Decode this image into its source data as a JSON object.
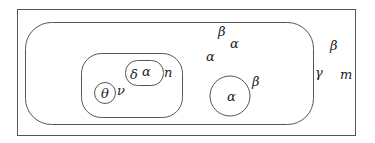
{
  "diagram": {
    "type": "nested-sets",
    "labels": {
      "outer_beta": "β",
      "outer_gamma": "γ",
      "outer_m": "m",
      "big_beta_top": "β",
      "big_alpha_top": "α",
      "big_alpha_left": "α",
      "inner_n": "n",
      "inner_nu": "ν",
      "pill_delta": "δ",
      "pill_alpha": "α",
      "small_theta": "θ",
      "right_circle_alpha": "α",
      "right_circle_beta": "β"
    },
    "stroke_color": "#555555",
    "text_color": "#222222"
  }
}
